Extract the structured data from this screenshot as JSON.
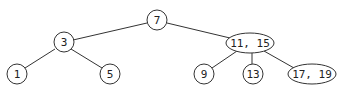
{
  "diagram": {
    "type": "2-3 tree",
    "nodes": [
      {
        "id": "n7",
        "label": "7"
      },
      {
        "id": "n3",
        "label": "3"
      },
      {
        "id": "n11_15",
        "label": "11, 15"
      },
      {
        "id": "n1",
        "label": "1"
      },
      {
        "id": "n5",
        "label": "5"
      },
      {
        "id": "n9",
        "label": "9"
      },
      {
        "id": "n13",
        "label": "13"
      },
      {
        "id": "n17_19",
        "label": "17, 19"
      }
    ],
    "edges": [
      [
        "n7",
        "n3"
      ],
      [
        "n7",
        "n11_15"
      ],
      [
        "n3",
        "n1"
      ],
      [
        "n3",
        "n5"
      ],
      [
        "n11_15",
        "n9"
      ],
      [
        "n11_15",
        "n13"
      ],
      [
        "n11_15",
        "n17_19"
      ]
    ]
  }
}
